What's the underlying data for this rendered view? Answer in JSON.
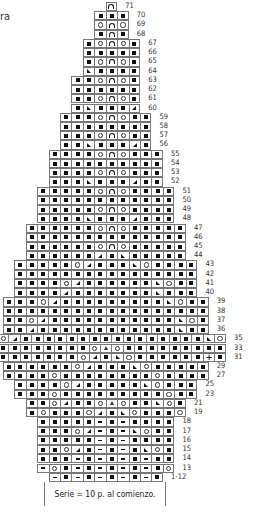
{
  "corner_text": "ra",
  "legend_note": "Serie = 10 p. al comienzo.",
  "symbols": {
    "B": "knit-stitch-filled-square",
    "O": "yarn-over-circle",
    "A": "arch-decrease",
    "L": "left-slant-decrease",
    "R": "right-slant-decrease",
    "T": "triangle-double-decrease",
    "D": "dash-purl",
    "P": "plus-stitch"
  },
  "grid": {
    "origin_x": -3,
    "cell_w": 11.45,
    "top": 2,
    "row_h": 9.23
  },
  "rows": [
    {
      "label": "71",
      "off": 9.5,
      "cells": "A"
    },
    {
      "label": "70",
      "off": 8.5,
      "cells": "BBB"
    },
    {
      "label": "69",
      "off": 8.5,
      "cells": "OAO"
    },
    {
      "label": "68",
      "off": 8.5,
      "cells": "BAB"
    },
    {
      "label": "67",
      "off": 7.5,
      "cells": "BOAOB"
    },
    {
      "label": "66",
      "off": 7.5,
      "cells": "BBBBB"
    },
    {
      "label": "65",
      "off": 7.5,
      "cells": "BOAOB"
    },
    {
      "label": "64",
      "off": 7.5,
      "cells": "LBBBB"
    },
    {
      "label": "63",
      "off": 6.5,
      "cells": "BBOAOB"
    },
    {
      "label": "62",
      "off": 6.5,
      "cells": "BBBBBB"
    },
    {
      "label": "61",
      "off": 6.5,
      "cells": "BBOAOB"
    },
    {
      "label": "60",
      "off": 6.5,
      "cells": "BLBBBR"
    },
    {
      "label": "59",
      "off": 5.5,
      "cells": "BBBOAOBB"
    },
    {
      "label": "58",
      "off": 5.5,
      "cells": "BBBBBBBB"
    },
    {
      "label": "57",
      "off": 5.5,
      "cells": "BBBOAOBB"
    },
    {
      "label": "56",
      "off": 5.5,
      "cells": "BBLBBBRB"
    },
    {
      "label": "55",
      "off": 4.5,
      "cells": "BBBBOAOBBB"
    },
    {
      "label": "54",
      "off": 4.5,
      "cells": "BBBBBBBBBB"
    },
    {
      "label": "53",
      "off": 4.5,
      "cells": "BBBBOAOBBB"
    },
    {
      "label": "52",
      "off": 4.5,
      "cells": "BBBLBBBRBB"
    },
    {
      "label": "51",
      "off": 3.5,
      "cells": "BBBBBOAOBBBB"
    },
    {
      "label": "50",
      "off": 3.5,
      "cells": "BBBBBBBBBBBB"
    },
    {
      "label": "49",
      "off": 3.5,
      "cells": "BBBBBOAOBBBB"
    },
    {
      "label": "48",
      "off": 3.5,
      "cells": "BBBBLBBBRBBB"
    },
    {
      "label": "47",
      "off": 2.5,
      "cells": "BBBBBBOAOBBBBB"
    },
    {
      "label": "46",
      "off": 2.5,
      "cells": "BBBBBBBBBBBBBB"
    },
    {
      "label": "45",
      "off": 2.5,
      "cells": "BBBBBBOAOBBBBB"
    },
    {
      "label": "44",
      "off": 2.5,
      "cells": "BBBBBBRBLBBBBB"
    },
    {
      "label": "43",
      "off": 1.5,
      "cells": "BBBBBORBBBLOBBBB"
    },
    {
      "label": "42",
      "off": 1.5,
      "cells": "BBBBBBBBBBBBBBBB"
    },
    {
      "label": "41",
      "off": 1.5,
      "cells": "BBBBORBBBBBBLOBB"
    },
    {
      "label": "40",
      "off": 1.5,
      "cells": "BBBBRBBBBBBBLBBB"
    },
    {
      "label": "39",
      "off": 0.5,
      "cells": "BBBORBBBBBBBBBLOBB"
    },
    {
      "label": "38",
      "off": 0.5,
      "cells": "BBBBBBBBBBBBBBBBBB"
    },
    {
      "label": "37",
      "off": 0.5,
      "cells": "BBORBBBBBBBBBBBLOB"
    },
    {
      "label": "36",
      "off": 0.5,
      "cells": "BBRBBBBBBBBBBBBLBB"
    },
    {
      "label": "35",
      "off": 0,
      "cells": "ORBBBBBBBBBBBBBBBBLO"
    },
    {
      "label": "33",
      "off": 0,
      "cells": "BBBBBBBBOTOBBBBBBBBB"
    },
    {
      "label": "31",
      "off": 0,
      "cells": "BBBBBBBORBLOBBBBBBPB"
    },
    {
      "label": "29",
      "off": 0.5,
      "cells": "BBBBBBORBBBLOBBBBB"
    },
    {
      "label": "27",
      "off": 0.5,
      "cells": "BBBBOBBBBBBBBOBBBB"
    },
    {
      "label": "25",
      "off": 1.5,
      "cells": "BBBBORBBBBBLOBBB"
    },
    {
      "label": "23",
      "off": 1.5,
      "cells": "BBBOBBBBBBBBBOBB"
    },
    {
      "label": "21",
      "off": 2.5,
      "cells": "BBORBBOTOBBLOB"
    },
    {
      "label": "19",
      "off": 2.5,
      "cells": "BOBBBORBLOBBBO"
    },
    {
      "label": "18",
      "off": 3.5,
      "cells": "BBBBBDBDBBBB"
    },
    {
      "label": "17",
      "off": 3.5,
      "cells": "BBBORDBDLOBB"
    },
    {
      "label": "16",
      "off": 3.5,
      "cells": "BBBBBDBDBBBB"
    },
    {
      "label": "15",
      "off": 3.5,
      "cells": "BBORBDBDBLOB"
    },
    {
      "label": "14",
      "off": 3.5,
      "cells": "BBBDBDBDBDBB"
    },
    {
      "label": "13",
      "off": 3.5,
      "cells": "DOBDBDBDBDBO"
    },
    {
      "label": "1-12",
      "off": 4.5,
      "cells": "DBDBDBDBDB"
    }
  ]
}
